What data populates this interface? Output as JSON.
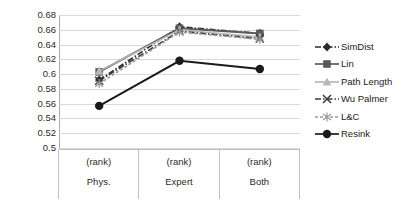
{
  "chart_data": {
    "type": "line",
    "title": "",
    "xlabel": "",
    "ylabel": "",
    "ylim": [
      0.5,
      0.68
    ],
    "ytick_labels": [
      "0.68",
      "0.66",
      "0.64",
      "0.62",
      "0.6",
      "0.58",
      "0.56",
      "0.54",
      "0.52",
      "0.5"
    ],
    "ytick_values": [
      0.68,
      0.66,
      0.64,
      0.62,
      0.6,
      0.58,
      0.56,
      0.54,
      0.52,
      0.5
    ],
    "grid": true,
    "legend_position": "right",
    "categories": [
      "Phys.",
      "Expert",
      "Both"
    ],
    "category_sublabels": [
      "(rank)",
      "(rank)",
      "(rank)"
    ],
    "series": [
      {
        "name": "SimDist",
        "values": [
          0.592,
          0.664,
          0.655
        ],
        "color": "#2b2b2b",
        "marker": "diamond",
        "dash": "dashdot"
      },
      {
        "name": "Lin",
        "values": [
          0.603,
          0.662,
          0.655
        ],
        "color": "#5a5a5a",
        "marker": "square",
        "dash": "solid"
      },
      {
        "name": "Path Length",
        "values": [
          0.604,
          0.66,
          0.65
        ],
        "color": "#b8b8b8",
        "marker": "triangle",
        "dash": "solid"
      },
      {
        "name": "Wu Palmer",
        "values": [
          0.591,
          0.658,
          0.648
        ],
        "color": "#3a3a3a",
        "marker": "cross",
        "dash": "dashdot"
      },
      {
        "name": "L&C",
        "values": [
          0.587,
          0.657,
          0.647
        ],
        "color": "#9a9a9a",
        "marker": "asterisk",
        "dash": "dashed"
      },
      {
        "name": "Resink",
        "values": [
          0.557,
          0.618,
          0.607
        ],
        "color": "#1a1a1a",
        "marker": "circle",
        "dash": "solid"
      }
    ]
  },
  "legend": {
    "items": [
      {
        "label": "SimDist"
      },
      {
        "label": "Lin"
      },
      {
        "label": "Path Length"
      },
      {
        "label": "Wu Palmer"
      },
      {
        "label": "L&C"
      },
      {
        "label": "Resink"
      }
    ]
  }
}
